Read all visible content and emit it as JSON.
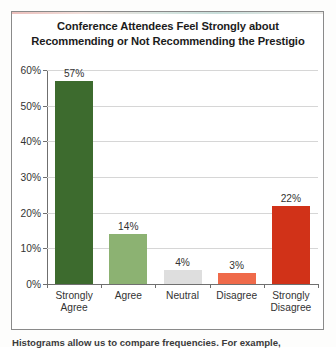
{
  "chart_data": {
    "type": "bar",
    "title": "Conference Attendees Feel Strongly about Recommending or Not Recommending the Prestigio",
    "title_line1": "Conference Attendees Feel Strongly about",
    "title_line2": "Recommending or Not Recommending the Prestigio",
    "categories": [
      "Strongly Agree",
      "Agree",
      "Neutral",
      "Disagree",
      "Strongly Disagree"
    ],
    "values": [
      57,
      14,
      4,
      3,
      22
    ],
    "value_labels": [
      "57%",
      "14%",
      "4%",
      "3%",
      "22%"
    ],
    "bar_colors": [
      "#3d6b2e",
      "#8cb272",
      "#dedede",
      "#ef6a4a",
      "#d13218"
    ],
    "xlabel": "",
    "ylabel": "",
    "ylim": [
      0,
      60
    ],
    "ytick_values": [
      0,
      10,
      20,
      30,
      40,
      50,
      60
    ],
    "ytick_labels": [
      "0%",
      "10%",
      "20%",
      "30%",
      "40%",
      "50%",
      "60%"
    ],
    "grid": true,
    "legend": false,
    "legend_position": "none"
  },
  "caption": {
    "text": "Histograms allow us to compare frequencies. For example,"
  },
  "categories_wrapped": [
    [
      "Strongly",
      "Agree"
    ],
    [
      "Agree",
      ""
    ],
    [
      "Neutral",
      ""
    ],
    [
      "Disagree",
      ""
    ],
    [
      "Strongly",
      "Disagree"
    ]
  ]
}
